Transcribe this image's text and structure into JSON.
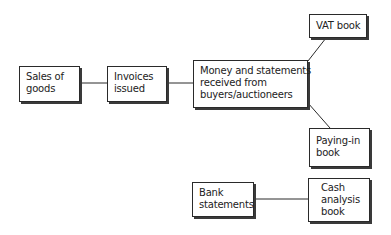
{
  "diagram": {
    "colors": {
      "line": "#2a2a2a",
      "shadow": "#3a3a3a",
      "background": "#ffffff"
    },
    "nodes": {
      "sales": {
        "lines": [
          "Sales of",
          "goods"
        ]
      },
      "invoices": {
        "lines": [
          "Invoices",
          "issued"
        ]
      },
      "money": {
        "lines": [
          "Money and statements",
          "received from",
          "buyers/auctioneers"
        ]
      },
      "vat": {
        "lines": [
          "VAT book"
        ]
      },
      "payingin": {
        "lines": [
          "Paying-in",
          "book"
        ]
      },
      "bank": {
        "lines": [
          "Bank",
          "statements"
        ]
      },
      "cash": {
        "lines": [
          "Cash",
          "analysis",
          "book"
        ]
      }
    },
    "edges": [
      {
        "from": "sales",
        "to": "invoices"
      },
      {
        "from": "invoices",
        "to": "money"
      },
      {
        "from": "money",
        "to": "vat"
      },
      {
        "from": "money",
        "to": "payingin"
      },
      {
        "from": "bank",
        "to": "cash"
      }
    ]
  }
}
